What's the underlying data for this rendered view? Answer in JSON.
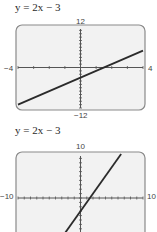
{
  "chart_data": [
    {
      "type": "line",
      "title": "y = 2x − 3",
      "function": "y = 2x - 3",
      "xlim": [
        -4,
        4
      ],
      "ylim": [
        -12,
        12
      ],
      "x_tick_labels": {
        "min": "−4",
        "max": "4"
      },
      "y_tick_labels": {
        "min": "−12",
        "max": "12"
      },
      "x_tick_step": 1,
      "y_tick_step": 1,
      "grid": false,
      "series": [
        {
          "name": "y = 2x − 3",
          "x": [
            -4,
            4
          ],
          "y": [
            -11,
            5
          ]
        }
      ]
    },
    {
      "type": "line",
      "title": "y = 2x − 3",
      "function": "y = 2x - 3",
      "xlim": [
        -10,
        10
      ],
      "ylim": [
        -10,
        10
      ],
      "x_tick_labels": {
        "min": "−10",
        "max": "10"
      },
      "y_tick_labels": {
        "max": "10"
      },
      "x_tick_step": 1,
      "y_tick_step": 1,
      "grid": false,
      "series": [
        {
          "name": "y = 2x − 3",
          "x": [
            -3.5,
            6.5
          ],
          "y": [
            -10,
            10
          ]
        }
      ]
    }
  ]
}
